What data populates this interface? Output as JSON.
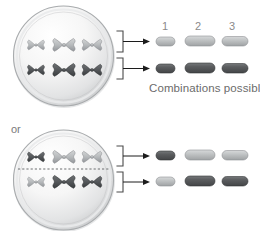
{
  "figure": {
    "title_text": "",
    "or_label": "or",
    "combinations_label": "Combinations possible",
    "column_numbers": [
      "1",
      "2",
      "3"
    ],
    "colors": {
      "light_chromosome": "#b9bcbd",
      "dark_chromosome": "#57585a",
      "cell_membrane": "#9a9c9e",
      "cell_fill_light": "#fbfbfb",
      "cell_fill_shadow": "#c9cbcd",
      "bracket": "#4a4a4a",
      "arrow": "#1c1c1c",
      "text": "#6e6e6e",
      "background": "#ffffff",
      "dashed_plate": "#6d6f71"
    }
  },
  "cells": [
    {
      "name": "upper-cell",
      "has_metaphase_plate": false,
      "rows": [
        {
          "name": "upper-row",
          "chromosomes": [
            {
              "shade": "light",
              "size": "small"
            },
            {
              "shade": "light",
              "size": "large"
            },
            {
              "shade": "light",
              "size": "medium"
            }
          ]
        },
        {
          "name": "lower-row",
          "chromosomes": [
            {
              "shade": "dark",
              "size": "small"
            },
            {
              "shade": "dark",
              "size": "large"
            },
            {
              "shade": "dark",
              "size": "medium"
            }
          ]
        }
      ]
    },
    {
      "name": "lower-cell",
      "has_metaphase_plate": true,
      "rows": [
        {
          "name": "upper-row",
          "chromosomes": [
            {
              "shade": "dark",
              "size": "small"
            },
            {
              "shade": "light",
              "size": "large"
            },
            {
              "shade": "light",
              "size": "medium"
            }
          ]
        },
        {
          "name": "lower-row",
          "chromosomes": [
            {
              "shade": "light",
              "size": "small"
            },
            {
              "shade": "dark",
              "size": "large"
            },
            {
              "shade": "dark",
              "size": "medium"
            }
          ]
        }
      ]
    }
  ],
  "gamete_groups": [
    {
      "name": "upper-gamete-group",
      "rows": [
        {
          "name": "gamete-row-1",
          "rods": [
            {
              "shade": "light",
              "size": "small"
            },
            {
              "shade": "light",
              "size": "large"
            },
            {
              "shade": "light",
              "size": "medium"
            }
          ]
        },
        {
          "name": "gamete-row-2",
          "rods": [
            {
              "shade": "dark",
              "size": "small"
            },
            {
              "shade": "dark",
              "size": "large"
            },
            {
              "shade": "dark",
              "size": "medium"
            }
          ]
        }
      ]
    },
    {
      "name": "lower-gamete-group",
      "rows": [
        {
          "name": "gamete-row-3",
          "rods": [
            {
              "shade": "dark",
              "size": "small"
            },
            {
              "shade": "light",
              "size": "large"
            },
            {
              "shade": "light",
              "size": "medium"
            }
          ]
        },
        {
          "name": "gamete-row-4",
          "rods": [
            {
              "shade": "light",
              "size": "small"
            },
            {
              "shade": "dark",
              "size": "large"
            },
            {
              "shade": "dark",
              "size": "medium"
            }
          ]
        }
      ]
    }
  ]
}
